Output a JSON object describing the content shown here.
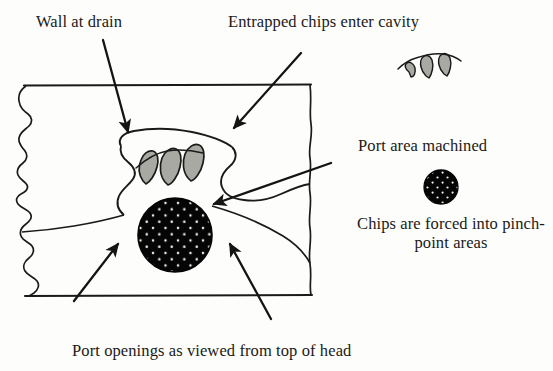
{
  "figure": {
    "type": "technical-cross-section-diagram",
    "background_color": "#fdfdfb",
    "ink_color": "#1a1a18",
    "chip_fill_color": "#a9a9a4",
    "port_fill_color": "#000000",
    "port_speckle_color": "#ffffff"
  },
  "labels": {
    "wall_at_drain": "Wall at drain",
    "entrapped_chips": "Entrapped chips enter cavity",
    "port_area_machined": "Port area machined",
    "chips_forced": "Chips are forced into pinch-point areas",
    "port_openings_caption": "Port openings as viewed from top of head"
  },
  "icons": {
    "chip_cluster": "chip-curl-icon",
    "port_circle": "port-opening-icon"
  },
  "annotations": [
    {
      "name": "arrow-wall-at-drain",
      "from": [
        103,
        40
      ],
      "to": [
        129,
        135
      ]
    },
    {
      "name": "arrow-entrapped-chips",
      "from": [
        300,
        55
      ],
      "to": [
        233,
        130
      ]
    },
    {
      "name": "arrow-port-area",
      "from": [
        330,
        163
      ],
      "to": [
        212,
        205
      ]
    },
    {
      "name": "arrow-port-left",
      "from": [
        74,
        300
      ],
      "to": [
        117,
        243
      ]
    },
    {
      "name": "arrow-port-right",
      "from": [
        270,
        318
      ],
      "to": [
        228,
        243
      ]
    }
  ],
  "geometry": {
    "frame_top_y": 85,
    "frame_bottom_y": 296,
    "frame_left_x": 24,
    "frame_right_x": 311,
    "port_circle_center": [
      175,
      235
    ],
    "port_circle_radius": 37,
    "small_port_circle_center": [
      441,
      187
    ],
    "small_port_circle_radius": 17
  }
}
